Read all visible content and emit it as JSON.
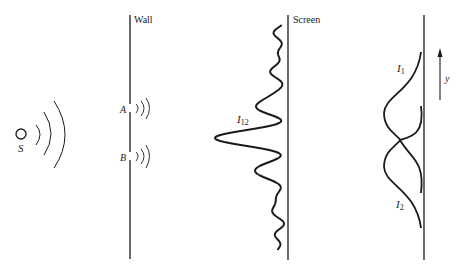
{
  "diagram": {
    "labels": {
      "wall": "Wall",
      "screen": "Screen",
      "source": "S",
      "slit_a": "A",
      "slit_b": "B",
      "combined_intensity": "I",
      "combined_intensity_sub": "12",
      "intensity_1": "I",
      "intensity_1_sub": "1",
      "intensity_2": "I",
      "intensity_2_sub": "2",
      "axis": "y"
    },
    "colors": {
      "ink": "#1a1a1a",
      "background": "#ffffff"
    },
    "components": [
      {
        "id": "source",
        "kind": "point source with wavefronts"
      },
      {
        "id": "wall",
        "kind": "barrier with two slits A and B"
      },
      {
        "id": "screen",
        "kind": "detector screen with interference pattern I12"
      },
      {
        "id": "single-slit-patterns",
        "kind": "individual intensity curves I1 and I2 with y-axis arrow"
      }
    ]
  }
}
